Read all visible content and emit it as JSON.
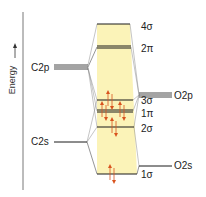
{
  "axis": {
    "label": "Energy"
  },
  "atomic_orbitals": {
    "left": [
      {
        "id": "c2p",
        "label": "C2p"
      },
      {
        "id": "c2s",
        "label": "C2s"
      }
    ],
    "right": [
      {
        "id": "o2p",
        "label": "O2p"
      },
      {
        "id": "o2s",
        "label": "O2s"
      }
    ]
  },
  "molecular_orbitals": [
    {
      "id": "4sigma",
      "label": "4σ",
      "electrons": 0,
      "degenerate": false
    },
    {
      "id": "2pi",
      "label": "2π",
      "electrons": 0,
      "degenerate": true
    },
    {
      "id": "3sigma",
      "label": "3σ",
      "electrons": 2,
      "degenerate": false
    },
    {
      "id": "1pi",
      "label": "1π",
      "electrons": 4,
      "degenerate": true
    },
    {
      "id": "2sigma",
      "label": "2σ",
      "electrons": 2,
      "degenerate": false
    },
    {
      "id": "1sigma",
      "label": "1σ",
      "electrons": 2,
      "degenerate": false
    }
  ],
  "colors": {
    "band": "#fbf3b8",
    "line": "#1a1a1a",
    "connector": "#8a8a8a",
    "electron": "#d9531e"
  }
}
